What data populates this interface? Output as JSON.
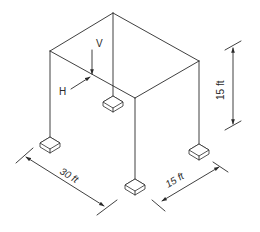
{
  "diagram": {
    "type": "isometric-frame-structure",
    "loads": {
      "vertical": {
        "label": "V"
      },
      "horizontal": {
        "label": "H"
      }
    },
    "dimensions": {
      "height": {
        "label": "15 ft"
      },
      "length": {
        "label": "30 ft"
      },
      "width": {
        "label": "15 ft"
      }
    },
    "colors": {
      "line": "#2a2a2a",
      "background": "#ffffff"
    }
  }
}
